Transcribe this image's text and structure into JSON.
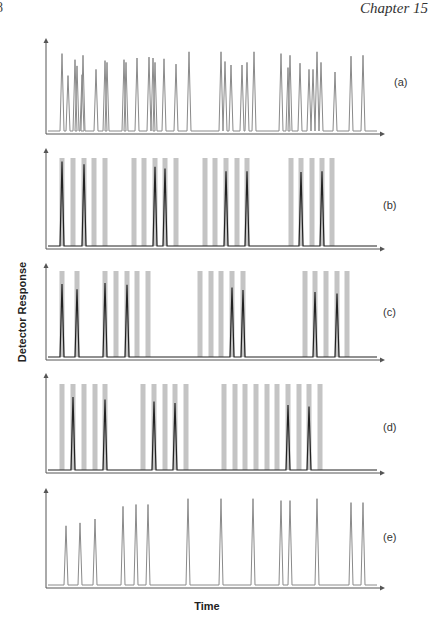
{
  "page": {
    "page_number_fragment": "8",
    "running_header": "Chapter 15"
  },
  "chart_data": {
    "type": "line",
    "title": "",
    "xlabel": "Time",
    "ylabel": "Detector Response",
    "grid": false,
    "legend": null,
    "x_range_px": [
      46,
      385
    ],
    "note": "Five stacked panels (a)-(e); x positions are in figure pixel units along the time axis, heights are relative peak heights (0-1). Gray bands are time gates.",
    "panels": [
      {
        "label": "(a)",
        "line_color": "#8a8a8a",
        "gates": [],
        "peaks": [
          {
            "x": 62,
            "h": 0.88
          },
          {
            "x": 68,
            "h": 0.63
          },
          {
            "x": 75,
            "h": 0.81
          },
          {
            "x": 77,
            "h": 0.74
          },
          {
            "x": 82,
            "h": 0.64
          },
          {
            "x": 83,
            "h": 0.86
          },
          {
            "x": 96,
            "h": 0.7
          },
          {
            "x": 105,
            "h": 0.8
          },
          {
            "x": 107,
            "h": 0.78
          },
          {
            "x": 124,
            "h": 0.81
          },
          {
            "x": 126,
            "h": 0.78
          },
          {
            "x": 137,
            "h": 0.83
          },
          {
            "x": 149,
            "h": 0.84
          },
          {
            "x": 153,
            "h": 0.83
          },
          {
            "x": 155,
            "h": 0.78
          },
          {
            "x": 164,
            "h": 0.82
          },
          {
            "x": 176,
            "h": 0.76
          },
          {
            "x": 189,
            "h": 0.9
          },
          {
            "x": 221,
            "h": 0.9
          },
          {
            "x": 225,
            "h": 0.79
          },
          {
            "x": 231,
            "h": 0.75
          },
          {
            "x": 242,
            "h": 0.75
          },
          {
            "x": 247,
            "h": 0.78
          },
          {
            "x": 254,
            "h": 0.9
          },
          {
            "x": 281,
            "h": 0.88
          },
          {
            "x": 288,
            "h": 0.72
          },
          {
            "x": 290,
            "h": 0.86
          },
          {
            "x": 300,
            "h": 0.77
          },
          {
            "x": 309,
            "h": 0.7
          },
          {
            "x": 313,
            "h": 0.7
          },
          {
            "x": 317,
            "h": 0.9
          },
          {
            "x": 321,
            "h": 0.78
          },
          {
            "x": 335,
            "h": 0.67
          },
          {
            "x": 351,
            "h": 0.85
          },
          {
            "x": 363,
            "h": 0.86
          }
        ]
      },
      {
        "label": "(b)",
        "line_color": "#222222",
        "gates": [
          62,
          73,
          84,
          94,
          105,
          134,
          144,
          155,
          165,
          176,
          205,
          215,
          226,
          237,
          247,
          291,
          301,
          312,
          322,
          332
        ],
        "peaks": [
          {
            "x": 62,
            "h": 0.96
          },
          {
            "x": 84,
            "h": 0.93
          },
          {
            "x": 155,
            "h": 0.9
          },
          {
            "x": 165,
            "h": 0.88
          },
          {
            "x": 226,
            "h": 0.85
          },
          {
            "x": 247,
            "h": 0.85
          },
          {
            "x": 301,
            "h": 0.84
          },
          {
            "x": 322,
            "h": 0.85
          }
        ]
      },
      {
        "label": "(c)",
        "line_color": "#222222",
        "gates": [
          62,
          77,
          105,
          116,
          127,
          137,
          148,
          200,
          211,
          221,
          232,
          243,
          305,
          315,
          326,
          337,
          347
        ],
        "peaks": [
          {
            "x": 62,
            "h": 0.83
          },
          {
            "x": 77,
            "h": 0.77
          },
          {
            "x": 105,
            "h": 0.84
          },
          {
            "x": 127,
            "h": 0.82
          },
          {
            "x": 232,
            "h": 0.79
          },
          {
            "x": 243,
            "h": 0.76
          },
          {
            "x": 315,
            "h": 0.74
          },
          {
            "x": 337,
            "h": 0.72
          }
        ]
      },
      {
        "label": "(d)",
        "line_color": "#222222",
        "gates": [
          62,
          73,
          84,
          95,
          105,
          143,
          154,
          165,
          175,
          186,
          224,
          235,
          245,
          256,
          267,
          277,
          288,
          299,
          309,
          320
        ],
        "peaks": [
          {
            "x": 73,
            "h": 0.83
          },
          {
            "x": 105,
            "h": 0.8
          },
          {
            "x": 154,
            "h": 0.78
          },
          {
            "x": 175,
            "h": 0.76
          },
          {
            "x": 288,
            "h": 0.74
          },
          {
            "x": 309,
            "h": 0.72
          }
        ]
      },
      {
        "label": "(e)",
        "line_color": "#8a8a8a",
        "gates": [],
        "peaks": [
          {
            "x": 66,
            "h": 0.61
          },
          {
            "x": 80,
            "h": 0.64
          },
          {
            "x": 95,
            "h": 0.68
          },
          {
            "x": 123,
            "h": 0.81
          },
          {
            "x": 136,
            "h": 0.83
          },
          {
            "x": 148,
            "h": 0.83
          },
          {
            "x": 188,
            "h": 0.89
          },
          {
            "x": 221,
            "h": 0.89
          },
          {
            "x": 253,
            "h": 0.89
          },
          {
            "x": 281,
            "h": 0.87
          },
          {
            "x": 290,
            "h": 0.87
          },
          {
            "x": 317,
            "h": 0.89
          },
          {
            "x": 351,
            "h": 0.85
          },
          {
            "x": 363,
            "h": 0.85
          }
        ]
      }
    ]
  },
  "colors": {
    "axis": "#555555",
    "gate": "#c4c4c4",
    "trace_light": "#8a8a8a",
    "trace_dark": "#222222"
  }
}
